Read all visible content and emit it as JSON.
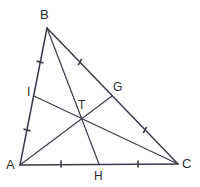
{
  "figure": {
    "background_color": "#ffffff",
    "line_color": "#3b3b4a",
    "tick_color": "#44444f",
    "label_color": "#2b2b33",
    "vertices": [
      {
        "id": "A",
        "label": "A",
        "x": 20,
        "y": 165,
        "label_x": 6,
        "label_y": 158
      },
      {
        "id": "B",
        "label": "B",
        "x": 47,
        "y": 28,
        "label_x": 40,
        "label_y": 8
      },
      {
        "id": "C",
        "label": "C",
        "x": 178,
        "y": 164,
        "label_x": 182,
        "label_y": 157
      }
    ],
    "midpoints": [
      {
        "id": "G",
        "label": "G",
        "on_side": "BC",
        "x": 112,
        "y": 96,
        "label_x": 113,
        "label_y": 81
      },
      {
        "id": "H",
        "label": "H",
        "on_side": "AC",
        "x": 99,
        "y": 164,
        "label_x": 94,
        "label_y": 170
      },
      {
        "id": "I",
        "label": "I",
        "on_side": "AB",
        "x": 34,
        "y": 96,
        "label_x": 27,
        "label_y": 86
      }
    ],
    "centroid": {
      "id": "T",
      "label": "T",
      "x": 84,
      "y": 116,
      "label_x": 78,
      "label_y": 99
    },
    "sides": [
      {
        "id": "AB",
        "from": "A",
        "to": "B"
      },
      {
        "id": "BC",
        "from": "B",
        "to": "C"
      },
      {
        "id": "AC",
        "from": "A",
        "to": "C"
      }
    ],
    "medians": [
      {
        "id": "AG",
        "from": "A",
        "to": "G"
      },
      {
        "id": "BH",
        "from": "B",
        "to": "H"
      },
      {
        "id": "CI",
        "from": "C",
        "to": "I"
      }
    ],
    "tick_marks": [
      {
        "id": "tick-AI",
        "segment": "A-I",
        "x": 27,
        "y": 130,
        "angle": 14
      },
      {
        "id": "tick-IB",
        "segment": "I-B",
        "x": 40,
        "y": 62,
        "angle": 14
      },
      {
        "id": "tick-BG",
        "segment": "B-G",
        "x": 80,
        "y": 62,
        "angle": 118
      },
      {
        "id": "tick-GC",
        "segment": "G-C",
        "x": 145,
        "y": 130,
        "angle": 118
      },
      {
        "id": "tick-AH",
        "segment": "A-H",
        "x": 61,
        "y": 164,
        "angle": 90
      },
      {
        "id": "tick-HC",
        "segment": "H-C",
        "x": 138,
        "y": 164,
        "angle": 90
      }
    ]
  }
}
